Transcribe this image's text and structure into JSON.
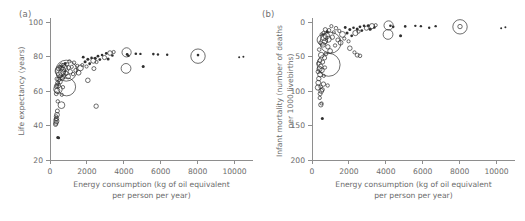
{
  "figure": {
    "panels": [
      {
        "tag": "(a)",
        "xlabel_line1": "Energy consumption (kg of oil equivalent",
        "xlabel_line2": "per person per year)",
        "ylabel_line1": "Life expectancy (years)"
      },
      {
        "tag": "(b)",
        "xlabel_line1": "Energy consumption (kg of oil equivalent",
        "xlabel_line2": "per person per year)",
        "ylabel_line1": "Infant mortality (number of deaths",
        "ylabel_line2": "per 1000 livebirths)"
      }
    ],
    "colors": {
      "axis": "#8e8e8e",
      "text": "#6b6b6b",
      "marker": "#2f2f2f",
      "background": "#ffffff"
    }
  },
  "chart_data": [
    {
      "type": "scatter",
      "title": "",
      "panel": "(a)",
      "xlabel": "Energy consumption (kg of oil equivalent per person per year)",
      "ylabel": "Life expectancy (years)",
      "xlim": [
        0,
        11000
      ],
      "ylim": [
        20,
        100
      ],
      "xticks": [
        0,
        2000,
        4000,
        6000,
        8000,
        10000
      ],
      "yticks": [
        20,
        40,
        60,
        80,
        100
      ],
      "grid": false,
      "legend": "none",
      "size_encodes": "population",
      "points": [
        {
          "x": 8020,
          "y": 80.2,
          "r": 7.2
        },
        {
          "x": 8020,
          "y": 80.8,
          "r": 1.3
        },
        {
          "x": 10250,
          "y": 79.6,
          "r": 1.0
        },
        {
          "x": 10480,
          "y": 79.9,
          "r": 1.0
        },
        {
          "x": 4150,
          "y": 82.4,
          "r": 4.6
        },
        {
          "x": 4180,
          "y": 81.2,
          "r": 1.4
        },
        {
          "x": 4250,
          "y": 80.4,
          "r": 1.3
        },
        {
          "x": 4120,
          "y": 73.1,
          "r": 4.9
        },
        {
          "x": 5050,
          "y": 74.2,
          "r": 1.5
        },
        {
          "x": 5600,
          "y": 81.4,
          "r": 1.3
        },
        {
          "x": 5850,
          "y": 81.2,
          "r": 1.2
        },
        {
          "x": 6350,
          "y": 81.0,
          "r": 1.2
        },
        {
          "x": 4650,
          "y": 81.6,
          "r": 1.3
        },
        {
          "x": 4900,
          "y": 81.5,
          "r": 1.2
        },
        {
          "x": 3450,
          "y": 82.6,
          "r": 1.6
        },
        {
          "x": 3250,
          "y": 82.0,
          "r": 2.3
        },
        {
          "x": 3380,
          "y": 80.6,
          "r": 1.3
        },
        {
          "x": 3050,
          "y": 81.8,
          "r": 1.4
        },
        {
          "x": 2950,
          "y": 79.4,
          "r": 2.1
        },
        {
          "x": 3150,
          "y": 78.6,
          "r": 1.5
        },
        {
          "x": 2820,
          "y": 80.9,
          "r": 1.3
        },
        {
          "x": 2700,
          "y": 78.2,
          "r": 1.4
        },
        {
          "x": 2600,
          "y": 80.2,
          "r": 1.4
        },
        {
          "x": 2520,
          "y": 76.8,
          "r": 1.6
        },
        {
          "x": 2450,
          "y": 79.0,
          "r": 1.5
        },
        {
          "x": 2350,
          "y": 77.6,
          "r": 2.6
        },
        {
          "x": 2250,
          "y": 79.2,
          "r": 1.3
        },
        {
          "x": 2150,
          "y": 75.8,
          "r": 1.4
        },
        {
          "x": 2050,
          "y": 78.4,
          "r": 1.5
        },
        {
          "x": 1980,
          "y": 74.2,
          "r": 1.6
        },
        {
          "x": 1900,
          "y": 77.0,
          "r": 1.5
        },
        {
          "x": 1800,
          "y": 79.6,
          "r": 1.4
        },
        {
          "x": 1750,
          "y": 75.0,
          "r": 1.6
        },
        {
          "x": 2380,
          "y": 73.0,
          "r": 2.0
        },
        {
          "x": 2050,
          "y": 66.2,
          "r": 2.3
        },
        {
          "x": 2500,
          "y": 51.2,
          "r": 2.2
        },
        {
          "x": 1650,
          "y": 73.4,
          "r": 2.9
        },
        {
          "x": 1550,
          "y": 70.6,
          "r": 2.4
        },
        {
          "x": 1480,
          "y": 74.6,
          "r": 1.6
        },
        {
          "x": 1400,
          "y": 72.0,
          "r": 2.0
        },
        {
          "x": 1300,
          "y": 76.4,
          "r": 1.8
        },
        {
          "x": 1250,
          "y": 69.8,
          "r": 1.7
        },
        {
          "x": 1180,
          "y": 74.0,
          "r": 1.6
        },
        {
          "x": 1100,
          "y": 71.2,
          "r": 2.2
        },
        {
          "x": 1050,
          "y": 77.2,
          "r": 1.6
        },
        {
          "x": 1000,
          "y": 73.6,
          "r": 2.0
        },
        {
          "x": 980,
          "y": 68.4,
          "r": 2.4
        },
        {
          "x": 920,
          "y": 75.4,
          "r": 1.8
        },
        {
          "x": 880,
          "y": 71.8,
          "r": 10.5
        },
        {
          "x": 860,
          "y": 70.2,
          "r": 2.2
        },
        {
          "x": 820,
          "y": 76.0,
          "r": 1.5
        },
        {
          "x": 780,
          "y": 73.2,
          "r": 3.2
        },
        {
          "x": 760,
          "y": 69.0,
          "r": 1.9
        },
        {
          "x": 720,
          "y": 74.8,
          "r": 2.0
        },
        {
          "x": 700,
          "y": 72.4,
          "r": 2.6
        },
        {
          "x": 680,
          "y": 67.6,
          "r": 2.1
        },
        {
          "x": 650,
          "y": 70.8,
          "r": 3.4
        },
        {
          "x": 620,
          "y": 75.2,
          "r": 1.7
        },
        {
          "x": 600,
          "y": 73.0,
          "r": 2.4
        },
        {
          "x": 580,
          "y": 68.8,
          "r": 2.0
        },
        {
          "x": 560,
          "y": 71.6,
          "r": 5.2
        },
        {
          "x": 540,
          "y": 65.4,
          "r": 2.3
        },
        {
          "x": 520,
          "y": 74.0,
          "r": 1.6
        },
        {
          "x": 500,
          "y": 69.4,
          "r": 2.8
        },
        {
          "x": 480,
          "y": 66.8,
          "r": 2.1
        },
        {
          "x": 460,
          "y": 72.8,
          "r": 1.8
        },
        {
          "x": 440,
          "y": 63.2,
          "r": 2.5
        },
        {
          "x": 900,
          "y": 62.4,
          "r": 9.0
        },
        {
          "x": 430,
          "y": 61.0,
          "r": 4.2
        },
        {
          "x": 410,
          "y": 64.6,
          "r": 2.0
        },
        {
          "x": 390,
          "y": 60.2,
          "r": 2.6
        },
        {
          "x": 370,
          "y": 67.0,
          "r": 1.8
        },
        {
          "x": 350,
          "y": 62.8,
          "r": 2.2
        },
        {
          "x": 340,
          "y": 58.4,
          "r": 1.9
        },
        {
          "x": 640,
          "y": 57.8,
          "r": 1.6
        },
        {
          "x": 700,
          "y": 62.2,
          "r": 1.7
        },
        {
          "x": 620,
          "y": 51.8,
          "r": 3.4
        },
        {
          "x": 420,
          "y": 54.0,
          "r": 1.7
        },
        {
          "x": 400,
          "y": 48.4,
          "r": 2.0
        },
        {
          "x": 380,
          "y": 46.2,
          "r": 2.4
        },
        {
          "x": 360,
          "y": 44.0,
          "r": 2.1
        },
        {
          "x": 345,
          "y": 42.6,
          "r": 2.6
        },
        {
          "x": 330,
          "y": 45.2,
          "r": 1.8
        },
        {
          "x": 320,
          "y": 41.4,
          "r": 2.2
        },
        {
          "x": 310,
          "y": 43.6,
          "r": 1.7
        },
        {
          "x": 300,
          "y": 40.6,
          "r": 2.0
        },
        {
          "x": 420,
          "y": 33.0,
          "r": 1.5
        },
        {
          "x": 470,
          "y": 32.8,
          "r": 1.4
        }
      ]
    },
    {
      "type": "scatter",
      "title": "",
      "panel": "(b)",
      "xlabel": "Energy consumption (kg of oil equivalent per person per year)",
      "ylabel": "Infant mortality (number of deaths per 1000 livebirths)",
      "xlim": [
        0,
        11000
      ],
      "ylim": [
        0,
        200
      ],
      "y_inverted": true,
      "xticks": [
        0,
        2000,
        4000,
        6000,
        8000,
        10000
      ],
      "yticks": [
        0,
        50,
        100,
        150,
        200
      ],
      "grid": false,
      "legend": "none",
      "size_encodes": "population",
      "points": [
        {
          "x": 8020,
          "y": 7.0,
          "r": 7.2
        },
        {
          "x": 8020,
          "y": 6.6,
          "r": 2.2
        },
        {
          "x": 10250,
          "y": 9.0,
          "r": 1.0
        },
        {
          "x": 10480,
          "y": 7.6,
          "r": 1.0
        },
        {
          "x": 4150,
          "y": 5.0,
          "r": 4.6
        },
        {
          "x": 4120,
          "y": 18.0,
          "r": 4.9
        },
        {
          "x": 4250,
          "y": 5.4,
          "r": 1.3
        },
        {
          "x": 4400,
          "y": 7.0,
          "r": 1.3
        },
        {
          "x": 4800,
          "y": 20.0,
          "r": 1.5
        },
        {
          "x": 5050,
          "y": 6.4,
          "r": 1.3
        },
        {
          "x": 5600,
          "y": 5.6,
          "r": 1.2
        },
        {
          "x": 5900,
          "y": 6.0,
          "r": 1.2
        },
        {
          "x": 6350,
          "y": 8.4,
          "r": 1.2
        },
        {
          "x": 6700,
          "y": 6.0,
          "r": 1.2
        },
        {
          "x": 3450,
          "y": 4.6,
          "r": 1.6
        },
        {
          "x": 3250,
          "y": 6.0,
          "r": 2.6
        },
        {
          "x": 3380,
          "y": 8.0,
          "r": 1.3
        },
        {
          "x": 3050,
          "y": 5.2,
          "r": 1.4
        },
        {
          "x": 3150,
          "y": 10.6,
          "r": 1.5
        },
        {
          "x": 2950,
          "y": 9.0,
          "r": 2.1
        },
        {
          "x": 2820,
          "y": 5.6,
          "r": 1.3
        },
        {
          "x": 2700,
          "y": 12.4,
          "r": 1.4
        },
        {
          "x": 2600,
          "y": 7.0,
          "r": 1.4
        },
        {
          "x": 2520,
          "y": 14.0,
          "r": 1.6
        },
        {
          "x": 2450,
          "y": 10.0,
          "r": 1.5
        },
        {
          "x": 2350,
          "y": 16.0,
          "r": 2.6
        },
        {
          "x": 2250,
          "y": 8.4,
          "r": 1.3
        },
        {
          "x": 2150,
          "y": 20.0,
          "r": 1.4
        },
        {
          "x": 2050,
          "y": 11.0,
          "r": 1.5
        },
        {
          "x": 2450,
          "y": 48.0,
          "r": 2.0
        },
        {
          "x": 2600,
          "y": 49.0,
          "r": 1.8
        },
        {
          "x": 2300,
          "y": 44.0,
          "r": 1.6
        },
        {
          "x": 2050,
          "y": 38.0,
          "r": 2.3
        },
        {
          "x": 1980,
          "y": 28.0,
          "r": 1.6
        },
        {
          "x": 1900,
          "y": 16.0,
          "r": 1.5
        },
        {
          "x": 1800,
          "y": 8.0,
          "r": 1.4
        },
        {
          "x": 1750,
          "y": 24.0,
          "r": 1.6
        },
        {
          "x": 1650,
          "y": 18.0,
          "r": 2.9
        },
        {
          "x": 1550,
          "y": 30.0,
          "r": 2.4
        },
        {
          "x": 1480,
          "y": 13.0,
          "r": 1.6
        },
        {
          "x": 1400,
          "y": 26.0,
          "r": 2.0
        },
        {
          "x": 1300,
          "y": 9.0,
          "r": 1.8
        },
        {
          "x": 1250,
          "y": 34.0,
          "r": 1.7
        },
        {
          "x": 1180,
          "y": 15.0,
          "r": 1.6
        },
        {
          "x": 1100,
          "y": 22.0,
          "r": 2.2
        },
        {
          "x": 1050,
          "y": 6.0,
          "r": 1.6
        },
        {
          "x": 1000,
          "y": 30.0,
          "r": 10.5
        },
        {
          "x": 980,
          "y": 42.0,
          "r": 2.4
        },
        {
          "x": 920,
          "y": 12.0,
          "r": 1.8
        },
        {
          "x": 880,
          "y": 25.0,
          "r": 3.0
        },
        {
          "x": 860,
          "y": 36.0,
          "r": 2.2
        },
        {
          "x": 820,
          "y": 14.0,
          "r": 1.5
        },
        {
          "x": 780,
          "y": 20.0,
          "r": 3.2
        },
        {
          "x": 760,
          "y": 46.0,
          "r": 1.9
        },
        {
          "x": 720,
          "y": 11.0,
          "r": 2.0
        },
        {
          "x": 700,
          "y": 28.0,
          "r": 2.6
        },
        {
          "x": 680,
          "y": 52.0,
          "r": 2.1
        },
        {
          "x": 650,
          "y": 22.0,
          "r": 3.4
        },
        {
          "x": 620,
          "y": 16.0,
          "r": 1.7
        },
        {
          "x": 600,
          "y": 33.0,
          "r": 2.4
        },
        {
          "x": 900,
          "y": 62.0,
          "r": 11.5
        },
        {
          "x": 580,
          "y": 58.0,
          "r": 2.0
        },
        {
          "x": 560,
          "y": 26.0,
          "r": 5.2
        },
        {
          "x": 540,
          "y": 70.0,
          "r": 2.3
        },
        {
          "x": 520,
          "y": 18.0,
          "r": 1.6
        },
        {
          "x": 500,
          "y": 48.0,
          "r": 2.8
        },
        {
          "x": 480,
          "y": 64.0,
          "r": 2.1
        },
        {
          "x": 460,
          "y": 30.0,
          "r": 1.8
        },
        {
          "x": 440,
          "y": 76.0,
          "r": 2.5
        },
        {
          "x": 430,
          "y": 56.0,
          "r": 2.0
        },
        {
          "x": 410,
          "y": 68.0,
          "r": 2.6
        },
        {
          "x": 390,
          "y": 40.0,
          "r": 1.8
        },
        {
          "x": 370,
          "y": 82.0,
          "r": 2.2
        },
        {
          "x": 350,
          "y": 60.0,
          "r": 1.9
        },
        {
          "x": 340,
          "y": 88.0,
          "r": 2.4
        },
        {
          "x": 330,
          "y": 72.0,
          "r": 2.0
        },
        {
          "x": 320,
          "y": 95.0,
          "r": 2.6
        },
        {
          "x": 640,
          "y": 78.0,
          "r": 1.6
        },
        {
          "x": 700,
          "y": 66.0,
          "r": 1.7
        },
        {
          "x": 620,
          "y": 90.0,
          "r": 2.2
        },
        {
          "x": 560,
          "y": 98.0,
          "r": 2.0
        },
        {
          "x": 500,
          "y": 100.0,
          "r": 2.4
        },
        {
          "x": 470,
          "y": 94.0,
          "r": 1.8
        },
        {
          "x": 440,
          "y": 104.0,
          "r": 2.0
        },
        {
          "x": 850,
          "y": 92.0,
          "r": 1.7
        },
        {
          "x": 420,
          "y": 110.0,
          "r": 1.7
        },
        {
          "x": 480,
          "y": 120.0,
          "r": 2.2
        },
        {
          "x": 520,
          "y": 118.0,
          "r": 1.6
        },
        {
          "x": 560,
          "y": 140.0,
          "r": 1.5
        }
      ]
    }
  ]
}
